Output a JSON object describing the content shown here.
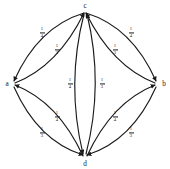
{
  "diagram": {
    "type": "directed-graph",
    "stroke_color": "#1a1a1a",
    "background_color": "#ffffff",
    "nodes": [
      {
        "id": "c",
        "label": "c",
        "x": 85,
        "y": 9
      },
      {
        "id": "a",
        "label": "a",
        "x": 11,
        "y": 84
      },
      {
        "id": "b",
        "label": "b",
        "x": 159,
        "y": 84
      },
      {
        "id": "d",
        "label": "d",
        "x": 85,
        "y": 158
      }
    ],
    "edges": [
      {
        "id": "c-a",
        "from": "c",
        "to": "a",
        "label_num": "1",
        "label_den": "4",
        "label_x": 42,
        "label_y": 33
      },
      {
        "id": "a-c",
        "from": "a",
        "to": "c",
        "label_num": "1",
        "label_den": "3",
        "label_x": 57,
        "label_y": 50
      },
      {
        "id": "c-b",
        "from": "c",
        "to": "b",
        "label_num": "1",
        "label_den": "4",
        "label_x": 131,
        "label_y": 33
      },
      {
        "id": "b-c",
        "from": "b",
        "to": "c",
        "label_num": "1",
        "label_den": "3",
        "label_x": 115,
        "label_y": 50
      },
      {
        "id": "c-d",
        "from": "c",
        "to": "d",
        "label_num": "1",
        "label_den": "4",
        "label_x": 70,
        "label_y": 84
      },
      {
        "id": "d-c",
        "from": "d",
        "to": "c",
        "label_num": "1",
        "label_den": "3",
        "label_x": 102,
        "label_y": 84
      },
      {
        "id": "a-d",
        "from": "a",
        "to": "d",
        "label_num": "1",
        "label_den": "3",
        "label_x": 42,
        "label_y": 133
      },
      {
        "id": "d-a",
        "from": "d",
        "to": "a",
        "label_num": "1",
        "label_den": "4",
        "label_x": 57,
        "label_y": 117
      },
      {
        "id": "b-d",
        "from": "b",
        "to": "d",
        "label_num": "1",
        "label_den": "3",
        "label_x": 131,
        "label_y": 133
      },
      {
        "id": "d-b",
        "from": "d",
        "to": "b",
        "label_num": "1",
        "label_den": "4",
        "label_x": 115,
        "label_y": 117
      }
    ]
  }
}
